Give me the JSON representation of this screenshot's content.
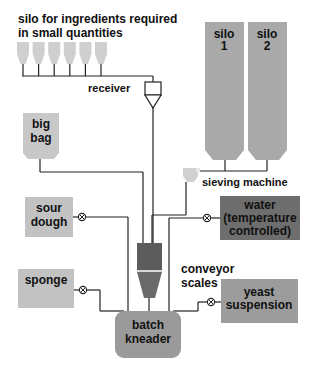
{
  "diagram": {
    "type": "process-flow",
    "topic": "bakery dough ingredient feed to batch kneader"
  },
  "colors": {
    "light_gray": "#c8c8c8",
    "silo_gray": "#a9a9a9",
    "medium_gray": "#9c9c9c",
    "dark_gray": "#6e6e6e",
    "kneader_gray": "#9a9a9a",
    "line": "#222222",
    "text": "#111111"
  },
  "labels": {
    "small_silos_line1": "silo for ingredients required",
    "small_silos_line2": "in small quantities",
    "receiver": "receiver",
    "silo1_line1": "silo",
    "silo1_line2": "1",
    "silo2_line1": "silo",
    "silo2_line2": "2",
    "sieving_machine": "sieving machine",
    "big_bag_line1": "big",
    "big_bag_line2": "bag",
    "sour_dough_line1": "sour",
    "sour_dough_line2": "dough",
    "water_line1": "water",
    "water_line2": "(temperature",
    "water_line3": "controlled)",
    "sponge": "sponge",
    "conveyor_scales_line1": "conveyor",
    "conveyor_scales_line2": "scales",
    "yeast_line1": "yeast",
    "yeast_line2": "suspension",
    "kneader_line1": "batch",
    "kneader_line2": "kneader"
  },
  "nodes": [
    {
      "id": "small-silos",
      "count": 6,
      "connects_to": "receiver"
    },
    {
      "id": "receiver",
      "connects_to": "scale-hopper"
    },
    {
      "id": "silo-1",
      "connects_to": "sieving-machine"
    },
    {
      "id": "silo-2",
      "connects_to": "sieving-machine"
    },
    {
      "id": "sieving-machine",
      "connects_to": "scale-hopper"
    },
    {
      "id": "big-bag",
      "connects_to": "scale-hopper"
    },
    {
      "id": "scale-hopper",
      "connects_to": "batch-kneader"
    },
    {
      "id": "sour-dough",
      "valve": true,
      "connects_to": "batch-kneader"
    },
    {
      "id": "water",
      "valve": true,
      "connects_to": "batch-kneader"
    },
    {
      "id": "sponge",
      "valve": true,
      "connects_to": "batch-kneader"
    },
    {
      "id": "yeast-suspension",
      "valve": true,
      "connects_to": "batch-kneader"
    },
    {
      "id": "batch-kneader"
    }
  ]
}
